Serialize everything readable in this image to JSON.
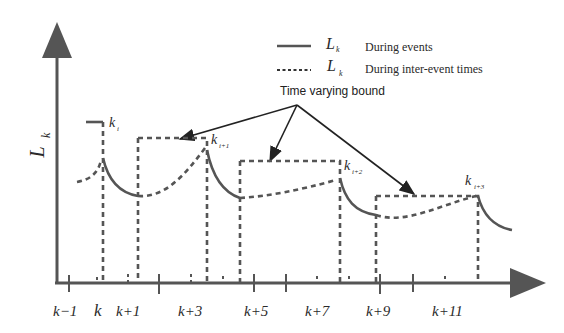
{
  "figure": {
    "y_axis_label": "L",
    "y_axis_subscript": "k",
    "legend": [
      {
        "style": "solid",
        "symbol": "L",
        "subscript": "k",
        "description": "During events"
      },
      {
        "style": "dashed",
        "symbol": "L",
        "subscript": "k",
        "description": "During inter-event times"
      }
    ],
    "annotation": "Time varying bound",
    "event_labels": [
      {
        "base": "k",
        "sub": "i"
      },
      {
        "base": "k",
        "sub": "i+1"
      },
      {
        "base": "k",
        "sub": "i+2"
      },
      {
        "base": "k",
        "sub": "i+3"
      }
    ],
    "x_tick_labels": [
      "k−1",
      "k",
      "k+1",
      "k+3",
      "k+5",
      "k+7",
      "k+9",
      "k+11"
    ]
  }
}
